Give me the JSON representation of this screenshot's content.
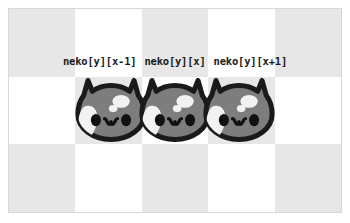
{
  "figure": {
    "name": "neko-array-index-diagram",
    "background_color": "#ffffff",
    "frame_border_color": "#d8d8d8"
  },
  "board": {
    "columns": 5,
    "rows": 3,
    "light_color": "#ffffff",
    "shade_color": "#e7e7e7",
    "pattern": [
      [
        "shade",
        "light",
        "shade",
        "light",
        "shade"
      ],
      [
        "light",
        "shade",
        "light",
        "shade",
        "light"
      ],
      [
        "shade",
        "light",
        "shade",
        "light",
        "shade"
      ]
    ]
  },
  "labels": [
    {
      "text": "neko[y][x-1]"
    },
    {
      "text": "neko[y][x]"
    },
    {
      "text": "neko[y][x+1]"
    }
  ],
  "cats": [
    {
      "index": "x-1"
    },
    {
      "index": "x"
    },
    {
      "index": "x+1"
    }
  ],
  "cat_colors": {
    "outline": "#1a1a1a",
    "body": "#7d7d7d",
    "patch": "#f2f2f2",
    "eye": "#111111",
    "mouth": "#111111"
  }
}
